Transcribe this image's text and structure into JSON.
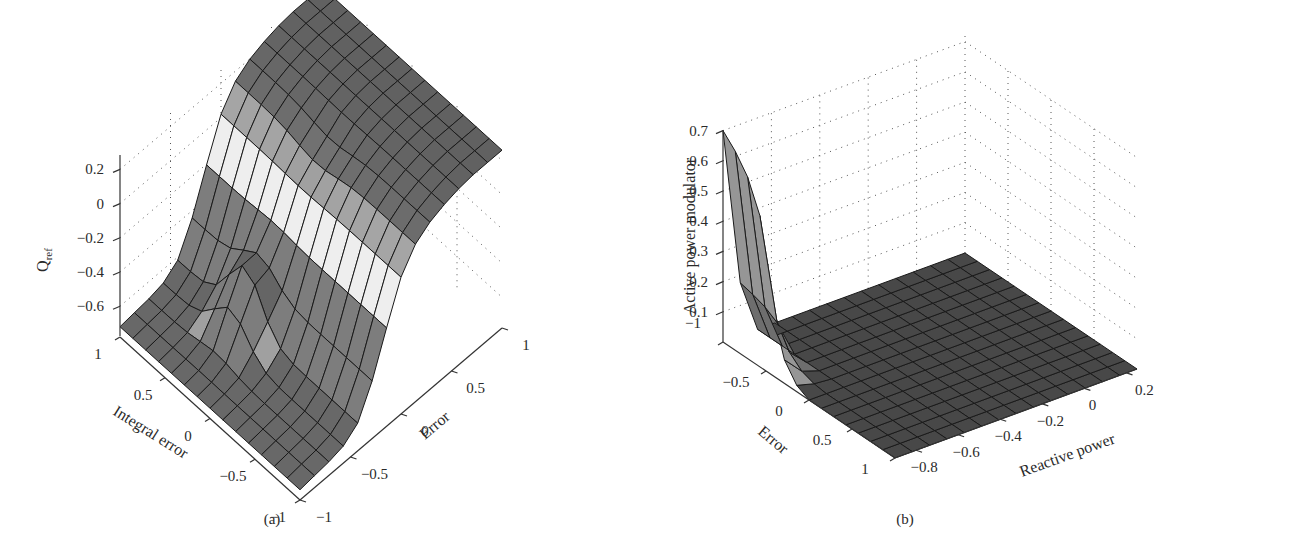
{
  "figure": {
    "panels": [
      {
        "id": "a",
        "label": "(a)"
      },
      {
        "id": "b",
        "label": "(b)"
      }
    ]
  },
  "chart_data": [
    {
      "type": "surface3d",
      "panel": "(a)",
      "title": "",
      "zlabel": "Q_ref",
      "zlabel_main": "Q",
      "zlabel_sub": "ref",
      "xlabel": "Integral error",
      "ylabel": "Error",
      "x_ticks": [
        "1",
        "0.5",
        "0",
        "−0.5",
        "−1"
      ],
      "y_ticks": [
        "−1",
        "−0.5",
        "0",
        "0.5",
        "1"
      ],
      "z_ticks": [
        "0.2",
        "0",
        "−0.2",
        "−0.4",
        "−0.6"
      ],
      "xlim": [
        -1,
        1
      ],
      "ylim": [
        -1,
        1
      ],
      "zlim": [
        -0.8,
        0.3
      ],
      "grid": true,
      "grid_size": [
        15,
        15
      ],
      "description": "Sigmoidal step surface: Q_ref ≈ −0.7 for Error < −0.3, rising steeply to ≈ +0.25 for Error > 0.2, with a bump near Integral error ≈ 0.3 in the transition region",
      "z_profile_vs_error": {
        "error": [
          -1,
          -0.86,
          -0.71,
          -0.57,
          -0.43,
          -0.29,
          -0.14,
          0,
          0.14,
          0.29,
          0.43,
          0.57,
          0.71,
          0.86,
          1
        ],
        "q_ref": [
          -0.72,
          -0.71,
          -0.7,
          -0.68,
          -0.62,
          -0.45,
          -0.2,
          0.02,
          0.14,
          0.2,
          0.23,
          0.25,
          0.26,
          0.26,
          0.26
        ]
      }
    },
    {
      "type": "surface3d",
      "panel": "(b)",
      "title": "",
      "zlabel": "Active power modulator",
      "xlabel": "Error",
      "ylabel": "Reactive power",
      "x_ticks": [
        "−1",
        "−0.5",
        "0",
        "0.5",
        "1"
      ],
      "y_ticks": [
        "−0.8",
        "−0.6",
        "−0.4",
        "−0.2",
        "0",
        "0.2"
      ],
      "z_ticks": [
        "0.7",
        "0.6",
        "0.5",
        "0.4",
        "0.3",
        "0.2",
        "0.1"
      ],
      "xlim": [
        -1,
        1
      ],
      "ylim": [
        -0.9,
        0.25
      ],
      "zlim": [
        0,
        0.7
      ],
      "grid": true,
      "grid_size": [
        15,
        15
      ],
      "description": "Flat surface at ≈0 everywhere except a sharp ridge near Error ≈ −1 to −0.2 at low Reactive power (≈ −0.9), peaking at ≈0.7",
      "peak": {
        "error": -1,
        "reactive_power": -0.9,
        "value": 0.7
      },
      "z_profile_vs_error_at_min_reactive": {
        "error": [
          -1,
          -0.86,
          -0.71,
          -0.57,
          -0.43,
          -0.29,
          -0.14,
          0
        ],
        "value": [
          0.7,
          0.66,
          0.6,
          0.5,
          0.22,
          0.08,
          0.02,
          0
        ]
      }
    }
  ]
}
